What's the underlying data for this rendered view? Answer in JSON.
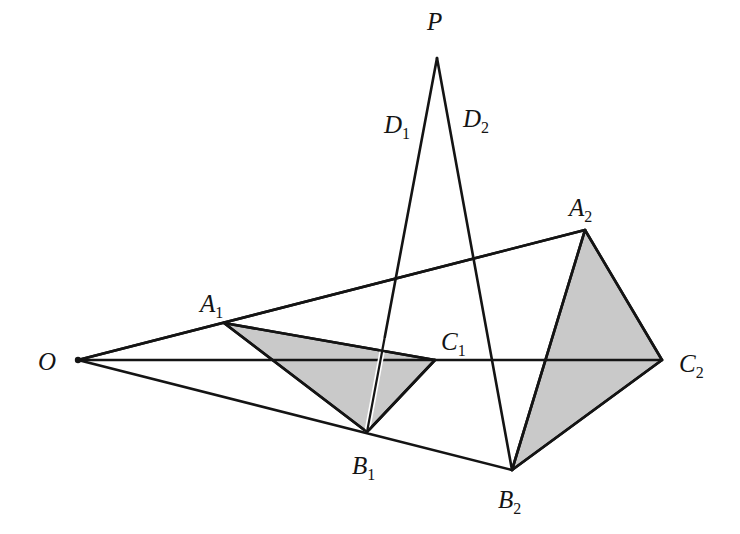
{
  "figure": {
    "background_color": "#ffffff",
    "stroke_color": "#141414",
    "fill_color": "#c9c9c9",
    "width": 740,
    "height": 534
  },
  "points": {
    "O": {
      "label": "O",
      "sub": "",
      "x": 78,
      "y": 360,
      "label_x": 38,
      "label_y": 370
    },
    "P": {
      "label": "P",
      "sub": "",
      "x": 437,
      "y": 58,
      "label_x": 427,
      "label_y": 30
    },
    "A1": {
      "label": "A",
      "sub": "1",
      "x": 224,
      "y": 323,
      "label_x": 200,
      "label_y": 312
    },
    "B1": {
      "label": "B",
      "sub": "1",
      "x": 367,
      "y": 432,
      "label_x": 352,
      "label_y": 474
    },
    "C1": {
      "label": "C",
      "sub": "1",
      "x": 435,
      "y": 360,
      "label_x": 441,
      "label_y": 350
    },
    "D1": {
      "label": "D",
      "sub": "1",
      "x": 423,
      "y": 137,
      "label_x": 384,
      "label_y": 133
    },
    "A2": {
      "label": "A",
      "sub": "2",
      "x": 585,
      "y": 230,
      "label_x": 569,
      "label_y": 216
    },
    "B2": {
      "label": "B",
      "sub": "2",
      "x": 512,
      "y": 470,
      "label_x": 498,
      "label_y": 508
    },
    "C2": {
      "label": "C",
      "sub": "2",
      "x": 662,
      "y": 360,
      "label_x": 679,
      "label_y": 372
    },
    "D2": {
      "label": "D",
      "sub": "2",
      "x": 457,
      "y": 130,
      "label_x": 463,
      "label_y": 127
    }
  },
  "segments": [
    {
      "name": "ray-O-to-D1-A2",
      "from": "O",
      "to": "A2",
      "via": "D1",
      "width": 2.6
    },
    {
      "name": "ray-O-to-A1-A2",
      "from": "O",
      "to": "A2",
      "via": "A1",
      "width": 2.6
    },
    {
      "name": "ray-O-to-C1-C2",
      "from": "O",
      "to": "C2",
      "via": "C1",
      "width": 2.6
    },
    {
      "name": "ray-O-to-B1-B2",
      "from": "O",
      "to": "B2",
      "via": "B1",
      "width": 2.6
    },
    {
      "name": "line-P-to-B1",
      "from": "P",
      "to": "B1",
      "via": "D1",
      "width": 2.6
    },
    {
      "name": "line-P-to-B2",
      "from": "P",
      "to": "B2",
      "via": "D2",
      "width": 2.6
    },
    {
      "name": "edge-A1-B1",
      "from": "A1",
      "to": "B1",
      "via": "",
      "width": 2.6
    },
    {
      "name": "edge-B1-C1",
      "from": "B1",
      "to": "C1",
      "via": "",
      "width": 2.6
    },
    {
      "name": "edge-A1-C1",
      "from": "A1",
      "to": "C1",
      "via": "",
      "width": 2.6
    },
    {
      "name": "edge-A2-B2",
      "from": "A2",
      "to": "B2",
      "via": "",
      "width": 2.6
    },
    {
      "name": "edge-B2-C2",
      "from": "B2",
      "to": "C2",
      "via": "",
      "width": 2.6
    },
    {
      "name": "edge-A2-C2",
      "from": "A2",
      "to": "C2",
      "via": "",
      "width": 2.6
    }
  ],
  "shaded_triangles": [
    {
      "name": "triangle-A1-B1-C1",
      "vertices": [
        "A1",
        "B1",
        "C1"
      ]
    },
    {
      "name": "triangle-A2-B2-C2",
      "vertices": [
        "A2",
        "B2",
        "C2"
      ]
    }
  ]
}
